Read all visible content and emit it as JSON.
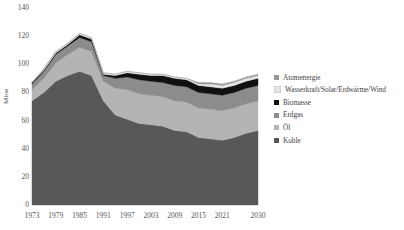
{
  "chart_data": {
    "type": "area",
    "stacked": true,
    "title": "",
    "subtitle": "",
    "xlabel": "",
    "ylabel": "Mtoe",
    "xlim": [
      1973,
      2030
    ],
    "ylim": [
      0,
      140
    ],
    "grid": false,
    "legend_position": "right",
    "x_tick_labels": [
      "1973",
      "1979",
      "1985",
      "1991",
      "1997",
      "2003",
      "2009",
      "2015",
      "2021",
      "2030"
    ],
    "x_tick_values": [
      1973,
      1979,
      1985,
      1991,
      1997,
      2003,
      2009,
      2015,
      2021,
      2030
    ],
    "y_tick_labels": [
      "0",
      "20",
      "40",
      "60",
      "80",
      "100",
      "120",
      "140"
    ],
    "y_tick_values": [
      0,
      20,
      40,
      60,
      80,
      100,
      120,
      140
    ],
    "x": [
      1973,
      1976,
      1979,
      1982,
      1985,
      1988,
      1991,
      1994,
      1997,
      2000,
      2003,
      2006,
      2009,
      2012,
      2015,
      2018,
      2021,
      2024,
      2027,
      2030
    ],
    "series": [
      {
        "name": "Kohle",
        "color": "#585858",
        "values": [
          74,
          80,
          88,
          92,
          95,
          92,
          74,
          64,
          61,
          58,
          57,
          56,
          53,
          52,
          48,
          47,
          46,
          48,
          51,
          53
        ]
      },
      {
        "name": "Öl",
        "color": "#b4b4b4",
        "values": [
          8,
          10,
          13,
          15,
          17,
          17,
          14,
          19,
          21,
          21,
          21,
          21,
          21,
          21,
          21,
          21,
          21,
          21,
          21,
          21
        ]
      },
      {
        "name": "Erdgas",
        "color": "#8c8c8c",
        "values": [
          4,
          5,
          6,
          6,
          7,
          7,
          4,
          7,
          9,
          10,
          10,
          10,
          11,
          11,
          11,
          11,
          11,
          11,
          11,
          11
        ]
      },
      {
        "name": "Biomasse",
        "color": "#111111",
        "values": [
          1,
          1,
          1,
          1,
          2,
          2,
          1,
          2,
          3,
          4,
          4,
          5,
          5,
          5,
          5,
          5,
          5,
          5,
          5,
          5
        ]
      },
      {
        "name": "Wasserkraft/Solar/Erdwärme/Wind",
        "color": "#e3e3e3",
        "values": [
          0,
          1,
          1,
          1,
          1,
          1,
          1,
          1,
          1,
          1,
          1,
          1,
          1,
          1,
          1,
          2,
          2,
          2,
          2,
          2
        ]
      },
      {
        "name": "Atomenergie",
        "color": "#999999",
        "values": [
          0,
          0,
          0,
          0,
          0,
          0,
          0,
          0,
          0,
          0,
          0,
          0,
          0,
          0,
          1,
          1,
          1,
          1,
          1,
          1
        ]
      }
    ]
  },
  "legend": {
    "entries": [
      {
        "label": "Atomenergie",
        "color": "#999999"
      },
      {
        "label": "Wasserkraft/Solar/Erdwärme/Wind",
        "color": "#e3e3e3"
      },
      {
        "label": "Biomasse",
        "color": "#111111"
      },
      {
        "label": "Erdgas",
        "color": "#8c8c8c"
      },
      {
        "label": "Öl",
        "color": "#b4b4b4"
      },
      {
        "label": "Kohle",
        "color": "#585858"
      }
    ]
  }
}
